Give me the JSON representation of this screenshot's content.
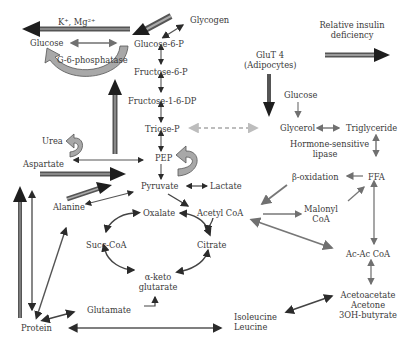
{
  "colors": {
    "dark_arrow": "#2b2b2b",
    "gray_arrow": "#6f6f6f",
    "light_dashed": "#bdbdbd",
    "curved_fill": "#9a9a9a",
    "text": "#3a3a3a"
  },
  "labels": {
    "ions": "K⁺, Mg²⁺",
    "glucose": "Glucose",
    "g6_phosphatase": "G-6-phosphatase",
    "glucose_6_p": "Glucose-6-P",
    "glycogen": "Glycogen",
    "fructose_6_p": "Fructose-6-P",
    "fructose_1_6_dp": "Fructose-1-6-DP",
    "triose_p": "Triose-P",
    "pep": "PEP",
    "pyruvate": "Pyruvate",
    "lactate": "Lactate",
    "urea": "Urea",
    "aspartate": "Aspartate",
    "alanine": "Alanine",
    "oxalate": "Oxalate",
    "acetyl_coa": "Acetyl CoA",
    "succ_coa": "Succ-CoA",
    "citrate": "Citrate",
    "alpha_keto_1": "α-keto",
    "alpha_keto_2": "glutarate",
    "glutamate": "Glutamate",
    "protein": "Protein",
    "isoleucine": "Isoleucine",
    "leucine": "Leucine",
    "insulin_1": "Relative insulin",
    "insulin_2": "deficiency",
    "glut4_1": "GluT 4",
    "glut4_2": "(Adipocytes)",
    "glucose_adipo": "Glucose",
    "glycerol": "Glycerol",
    "triglyceride": "Triglyceride",
    "hsl_1": "Hormone-sensitive",
    "hsl_2": "lipase",
    "beta_oxidation": "β-oxidation",
    "ffa": "FFA",
    "malonyl_1": "Malonyl",
    "malonyl_2": "CoA",
    "acac_coa": "Ac-Ac CoA",
    "ketone_1": "Acetoacetate",
    "ketone_2": "Acetone",
    "ketone_3": "3OH-butyrate"
  }
}
